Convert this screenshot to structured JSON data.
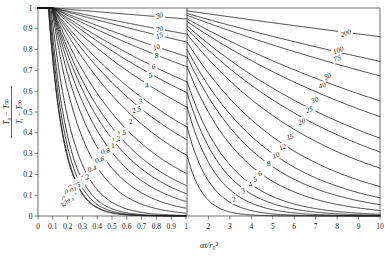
{
  "figure": {
    "kind": "heisler-chart",
    "title": "",
    "xlabel": "αt/r₀²",
    "ylabel_num": "T₀ − T∞",
    "ylabel_den": "Tᵢ − T∞",
    "curve_family_label": "k/hr₀",
    "line_color": "#1a1a1a",
    "axis_color": "#4a4a4a",
    "bg_color": "#ffffff"
  },
  "chart_data": {
    "type": "line",
    "title": "",
    "xlabel": "αt/r₀²",
    "ylabel": "(T₀ − T∞)/(Tᵢ − T∞)",
    "grid": false,
    "legend": "inline-curve-labels",
    "legend_title": "k/hr₀",
    "panels": [
      {
        "name": "left-panel",
        "xlim": [
          0,
          1
        ],
        "ylim": [
          0,
          1
        ],
        "xticks": [
          0,
          0.1,
          0.2,
          0.3,
          0.4,
          0.5,
          0.6,
          0.7,
          0.8,
          0.9,
          1
        ],
        "xticklabels": [
          "0",
          "0.1",
          "0.2",
          "0.3",
          "0.4",
          "0.5",
          "0.6",
          "0.7",
          "0.8",
          "0.9",
          "1"
        ],
        "yticks": [
          0,
          0.1,
          0.2,
          0.3,
          0.4,
          0.5,
          0.6,
          0.7,
          0.8,
          0.9,
          1
        ],
        "yticklabels": [
          "0",
          "0.1",
          "0.2",
          "0.3",
          "0.4",
          "0.5",
          "0.6",
          "0.7",
          "0.8",
          "0.9",
          "1"
        ],
        "curve_labels": [
          "50",
          "20",
          "15",
          "10",
          "8",
          "6",
          "5",
          "4",
          "3",
          "2.5",
          "2",
          "1.5",
          "1.2",
          "1",
          "0.8",
          "0.6",
          "0.4",
          "0.2",
          "0.1",
          "0.05",
          "0.01",
          "0.001"
        ]
      },
      {
        "name": "right-panel",
        "xlim": [
          1,
          10
        ],
        "ylim": [
          0,
          1
        ],
        "xticks": [
          1,
          2,
          3,
          4,
          5,
          6,
          7,
          8,
          9,
          10
        ],
        "xticklabels": [
          "1",
          "2",
          "3",
          "4",
          "5",
          "6",
          "7",
          "8",
          "9",
          "10"
        ],
        "curve_labels": [
          "200",
          "100",
          "75",
          "50",
          "40",
          "30",
          "25",
          "20",
          "15",
          "12",
          "10",
          "8",
          "6",
          "5",
          "4",
          "3",
          "2"
        ]
      }
    ],
    "series": [
      {
        "name": "200",
        "panel": "right",
        "bi_inv": 200
      },
      {
        "name": "100",
        "panel": "right",
        "bi_inv": 100
      },
      {
        "name": "75",
        "panel": "right",
        "bi_inv": 75
      },
      {
        "name": "50",
        "panel": "both",
        "bi_inv": 50
      },
      {
        "name": "40",
        "panel": "right",
        "bi_inv": 40
      },
      {
        "name": "30",
        "panel": "right",
        "bi_inv": 30
      },
      {
        "name": "25",
        "panel": "right",
        "bi_inv": 25
      },
      {
        "name": "20",
        "panel": "both",
        "bi_inv": 20
      },
      {
        "name": "15",
        "panel": "both",
        "bi_inv": 15
      },
      {
        "name": "12",
        "panel": "right",
        "bi_inv": 12
      },
      {
        "name": "10",
        "panel": "both",
        "bi_inv": 10
      },
      {
        "name": "8",
        "panel": "both",
        "bi_inv": 8
      },
      {
        "name": "6",
        "panel": "both",
        "bi_inv": 6
      },
      {
        "name": "5",
        "panel": "both",
        "bi_inv": 5
      },
      {
        "name": "4",
        "panel": "both",
        "bi_inv": 4
      },
      {
        "name": "3",
        "panel": "both",
        "bi_inv": 3
      },
      {
        "name": "2.5",
        "panel": "left",
        "bi_inv": 2.5
      },
      {
        "name": "2",
        "panel": "both",
        "bi_inv": 2
      },
      {
        "name": "1.5",
        "panel": "left",
        "bi_inv": 1.5
      },
      {
        "name": "1.2",
        "panel": "left",
        "bi_inv": 1.2
      },
      {
        "name": "1",
        "panel": "left",
        "bi_inv": 1
      },
      {
        "name": "0.8",
        "panel": "left",
        "bi_inv": 0.8
      },
      {
        "name": "0.6",
        "panel": "left",
        "bi_inv": 0.6
      },
      {
        "name": "0.4",
        "panel": "left",
        "bi_inv": 0.4
      },
      {
        "name": "0.2",
        "panel": "left",
        "bi_inv": 0.2
      },
      {
        "name": "0.1",
        "panel": "left",
        "bi_inv": 0.1
      },
      {
        "name": "0.05",
        "panel": "left",
        "bi_inv": 0.05
      },
      {
        "name": "0.01",
        "panel": "left",
        "bi_inv": 0.01
      },
      {
        "name": "0.001",
        "panel": "left",
        "bi_inv": 0.001
      }
    ]
  }
}
